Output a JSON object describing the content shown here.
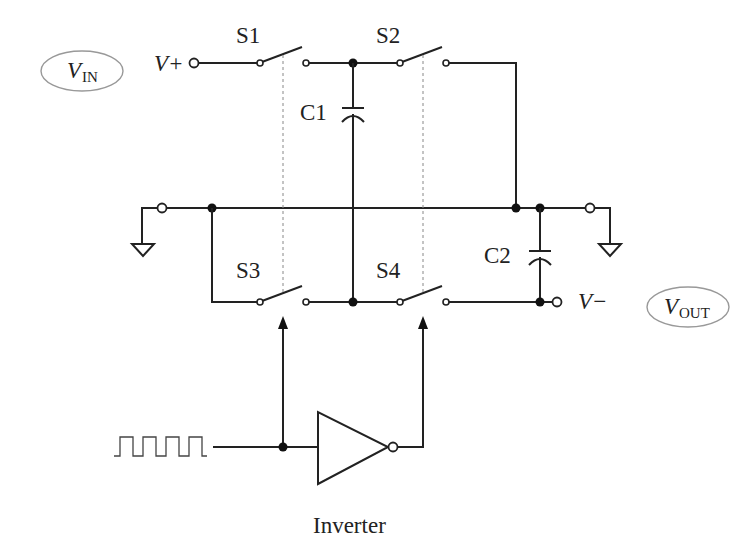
{
  "diagram": {
    "type": "circuit-schematic",
    "labels": {
      "vin_main": "V",
      "vin_sub": "IN",
      "vout_main": "V",
      "vout_sub": "OUT",
      "vplus": "V+",
      "vminus": "V−",
      "s1": "S1",
      "s2": "S2",
      "s3": "S3",
      "s4": "S4",
      "c1": "C1",
      "c2": "C2",
      "inverter": "Inverter"
    },
    "components": [
      {
        "id": "S1",
        "type": "switch",
        "between": [
          "V+",
          "C1 top"
        ]
      },
      {
        "id": "S2",
        "type": "switch",
        "between": [
          "C1 top",
          "common rail"
        ]
      },
      {
        "id": "S3",
        "type": "switch",
        "between": [
          "common rail",
          "C1 bottom"
        ]
      },
      {
        "id": "S4",
        "type": "switch",
        "between": [
          "C1 bottom",
          "V-"
        ]
      },
      {
        "id": "C1",
        "type": "capacitor",
        "role": "flying capacitor"
      },
      {
        "id": "C2",
        "type": "capacitor",
        "role": "output capacitor"
      },
      {
        "id": "INV",
        "type": "inverter",
        "input": "clock square wave"
      }
    ],
    "colors": {
      "line": "#222222",
      "dashed": "#888888",
      "oval": "#999999",
      "background": "#ffffff"
    }
  }
}
